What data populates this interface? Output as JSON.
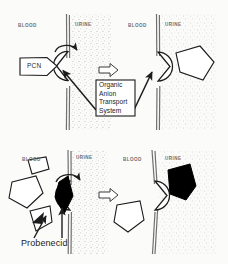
{
  "figure": {
    "background_color": "#fbfbfa",
    "ink_color": "#1c1c1c",
    "fill_black": "#000000",
    "membrane_color": "#7a7a7a",
    "urine_stipple_color": "#b9b9b9"
  },
  "panels": [
    {
      "id": "top-left",
      "blood_label": "BLOOD",
      "urine_label": "URINE",
      "substrate_label": "PCN",
      "substrate_state": "bound-at-transporter",
      "transporter_notch": "left",
      "substrate_color": "#ffffff"
    },
    {
      "id": "top-right",
      "blood_label": "BLOOD",
      "urine_label": "URINE",
      "substrate_label": "",
      "substrate_state": "released-into-urine",
      "transporter_notch": "right",
      "substrate_color": "#ffffff"
    },
    {
      "id": "bottom-left",
      "blood_label": "BLOOD",
      "urine_label": "URINE",
      "substrate_label": "Probenecid",
      "substrate_state": "bound-at-transporter",
      "transporter_notch": "left",
      "substrate_color": "#000000"
    },
    {
      "id": "bottom-right",
      "blood_label": "BLOOD",
      "urine_label": "URINE",
      "substrate_label": "",
      "substrate_state": "released-into-urine",
      "transporter_notch": "right",
      "substrate_color": "#000000"
    }
  ],
  "callout": {
    "lines": [
      "Organic",
      "Anion",
      "Transport",
      "System"
    ],
    "text": "Organic Anion Transport System",
    "points_to": "transporter-binding-site"
  },
  "arrows": {
    "top_transition": "block-arrow-right",
    "bottom_transition": "block-arrow-right",
    "rotation_hint": "curved-arrow-over-transporter"
  }
}
